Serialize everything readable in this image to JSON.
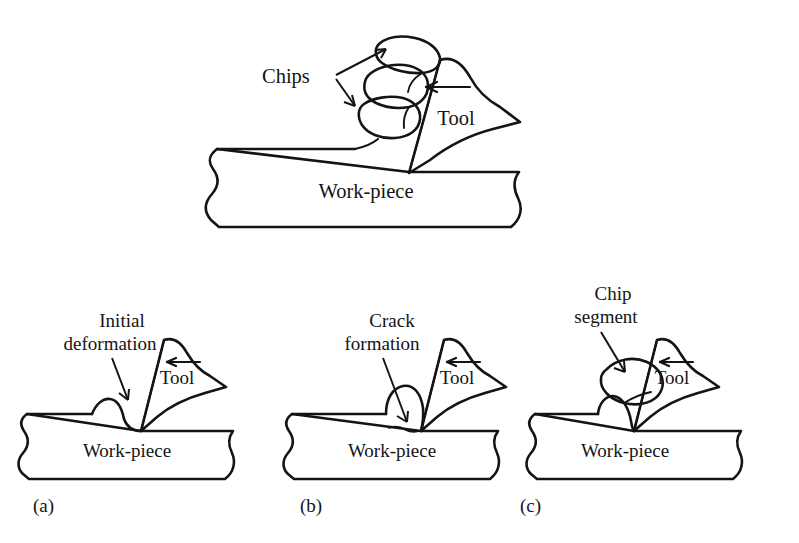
{
  "figure": {
    "background_color": "#ffffff",
    "ink_color": "#141414"
  },
  "top_diagram": {
    "name": "segmented-chip-overview",
    "labels": {
      "chips": "Chips",
      "tool": "Tool",
      "workpiece": "Work-piece"
    },
    "chip_segment_count": 3,
    "feed_arrow_direction": "left",
    "pointer_arrows": [
      {
        "from": "Chips",
        "to": "top-chip-segment"
      },
      {
        "from": "Chips",
        "to": "bottom-chip-segment"
      }
    ]
  },
  "panels": [
    {
      "tag": "(a)",
      "name": "panel-initial-deformation",
      "callout_line1": "Initial",
      "callout_line2": "deformation",
      "callout_text": "Initial deformation",
      "tool_label": "Tool",
      "workpiece_label": "Work-piece",
      "feed_arrow_direction": "left",
      "stage": "initial deformation bump ahead of tool"
    },
    {
      "tag": "(b)",
      "name": "panel-crack-formation",
      "callout_line1": "Crack",
      "callout_line2": "formation",
      "callout_text": "Crack formation",
      "tool_label": "Tool",
      "workpiece_label": "Work-piece",
      "feed_arrow_direction": "left",
      "stage": "crack initiates at tool tip under raised material"
    },
    {
      "tag": "(c)",
      "name": "panel-chip-segment",
      "callout_line1": "Chip",
      "callout_line2": "segment",
      "callout_text": "Chip segment",
      "tool_label": "Tool",
      "workpiece_label": "Work-piece",
      "feed_arrow_direction": "left",
      "stage": "discrete chip segment separated from work-piece"
    }
  ]
}
